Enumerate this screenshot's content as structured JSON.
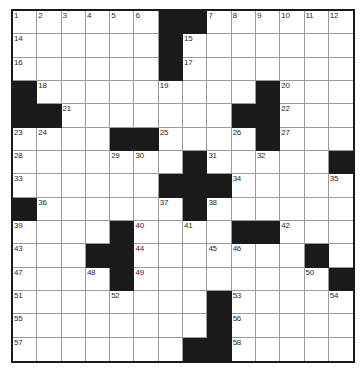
{
  "puzzle": {
    "title": "Crossword Grid",
    "type": "crossword-grid",
    "columns": 14,
    "rows": 15,
    "cell_size_px": 24.3,
    "colors": {
      "block": "#1a1a1a",
      "cell": "#ffffff",
      "gridline": "#9a9a9a",
      "border": "#1a1a1a",
      "number": "#2a2a2a"
    },
    "highest_number": 58,
    "grid": [
      [
        "1",
        "2",
        "3",
        "4",
        "5",
        "6",
        "#",
        "#",
        "7",
        "8",
        "9",
        "10",
        "11",
        "12"
      ],
      [
        "14",
        "",
        "",
        "",
        "",
        "",
        "#",
        "15",
        "",
        "",
        "",
        "",
        "",
        ""
      ],
      [
        "16",
        "",
        "",
        "",
        "",
        "",
        "#",
        "17",
        "",
        "",
        "",
        "",
        "",
        ""
      ],
      [
        "#",
        "18",
        "",
        "",
        "",
        "",
        "19",
        "",
        "",
        "",
        "#",
        "20",
        "",
        ""
      ],
      [
        "#",
        "#",
        "21",
        "",
        "",
        "",
        "",
        "",
        "",
        "#",
        "#",
        "22",
        "",
        ""
      ],
      [
        "23",
        "24",
        "",
        "",
        "#",
        "#",
        "25",
        "",
        "",
        "26",
        "#",
        "27",
        "",
        ""
      ],
      [
        "28",
        "",
        "",
        "",
        "29",
        "30",
        "",
        "#",
        "31",
        "",
        "32",
        "",
        "",
        "#"
      ],
      [
        "33",
        "",
        "",
        "",
        "",
        "",
        "#",
        "#",
        "#",
        "34",
        "",
        "",
        "",
        "35"
      ],
      [
        "#",
        "36",
        "",
        "",
        "",
        "",
        "37",
        "#",
        "38",
        "",
        "",
        "",
        "",
        ""
      ],
      [
        "39",
        "",
        "",
        "",
        "#",
        "40",
        "",
        "41",
        "",
        "#",
        "#",
        "42",
        "",
        ""
      ],
      [
        "43",
        "",
        "",
        "#",
        "#",
        "44",
        "",
        "",
        "45",
        "46",
        "",
        "",
        "#",
        ""
      ],
      [
        "47",
        "",
        "",
        "48",
        "#",
        "49",
        "",
        "",
        "",
        "",
        "",
        "",
        "50",
        "#"
      ],
      [
        "51",
        "",
        "",
        "",
        "52",
        "",
        "",
        "",
        "#",
        "53",
        "",
        "",
        "",
        "54"
      ],
      [
        "55",
        "",
        "",
        "",
        "",
        "",
        "",
        "",
        "#",
        "56",
        "",
        "",
        "",
        ""
      ],
      [
        "57",
        "",
        "",
        "",
        "",
        "",
        "",
        "#",
        "#",
        "58",
        "",
        "",
        "",
        ""
      ]
    ],
    "numbers_present": [
      1,
      2,
      3,
      4,
      5,
      6,
      7,
      8,
      9,
      10,
      11,
      12,
      13,
      14,
      15,
      16,
      17,
      18,
      19,
      20,
      21,
      22,
      23,
      24,
      25,
      26,
      27,
      28,
      29,
      30,
      31,
      32,
      33,
      34,
      35,
      36,
      37,
      38,
      39,
      40,
      41,
      42,
      43,
      44,
      45,
      46,
      47,
      48,
      49,
      50,
      51,
      52,
      53,
      54,
      55,
      56,
      57,
      58
    ]
  }
}
